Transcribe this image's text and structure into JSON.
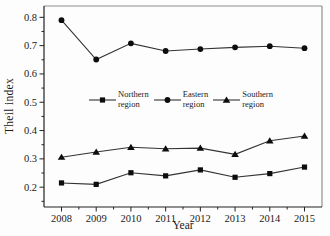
{
  "chart_data": {
    "type": "line",
    "title": "",
    "xlabel": "Year",
    "ylabel": "Theil index",
    "x": [
      2008,
      2009,
      2010,
      2011,
      2012,
      2013,
      2014,
      2015
    ],
    "ylim": [
      0.13,
      0.84
    ],
    "yticks": [
      0.2,
      0.3,
      0.4,
      0.5,
      0.6,
      0.7,
      0.8
    ],
    "ytick_labels": [
      "0.2",
      "0.3",
      "0.4",
      "0.5",
      "0.6",
      "0.7",
      "0.8"
    ],
    "y_minor_step": 0.05,
    "grid": false,
    "legend_position": "inside-center",
    "series": [
      {
        "name": "Northern region",
        "marker": "square",
        "values": [
          0.215,
          0.21,
          0.251,
          0.24,
          0.261,
          0.235,
          0.248,
          0.271
        ]
      },
      {
        "name": "Eastern region",
        "marker": "circle",
        "values": [
          0.79,
          0.651,
          0.708,
          0.681,
          0.688,
          0.694,
          0.698,
          0.691
        ]
      },
      {
        "name": "Southern region",
        "marker": "triangle",
        "values": [
          0.306,
          0.324,
          0.341,
          0.336,
          0.338,
          0.316,
          0.364,
          0.381
        ]
      }
    ],
    "colors": {
      "line": "#333333",
      "marker": "#0d0d0d",
      "axis": "#222222",
      "frame_top_right": "#909090",
      "background": "#fdfdfd"
    }
  }
}
